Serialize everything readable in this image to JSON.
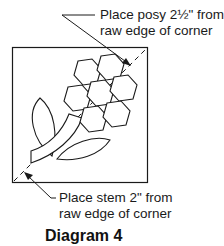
{
  "diagram": {
    "title": "Diagram 4",
    "callout_top": {
      "line1": "Place posy 2½\" from",
      "line2": "raw edge of corner"
    },
    "callout_bottom": {
      "line1": "Place stem 2\" from",
      "line2": "raw edge of corner"
    },
    "elements": [
      "square-block",
      "diagonal-dashed-guide",
      "hexagon-posy-7",
      "stem",
      "leaf-upper",
      "leaf-lower",
      "arrow-top",
      "arrow-bottom"
    ],
    "colors": {
      "stroke": "#1a1a1a",
      "background": "#ffffff"
    }
  }
}
